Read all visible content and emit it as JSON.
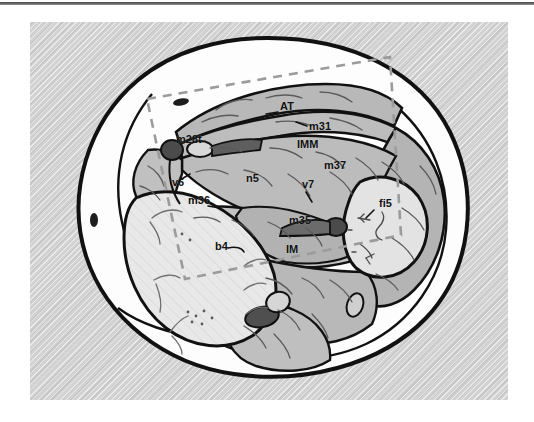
{
  "figure": {
    "type": "anatomical-cross-section-illustration",
    "caption": "",
    "plate_background_color": "#d2d2d2",
    "ink_color": "#111111",
    "roi_outline_color": "#9b9b9b",
    "roi_outline_style": "dashed",
    "fills": {
      "skin_fat_layer": "#fdfdfd",
      "muscle_mid_gray": "#b4b4b4",
      "muscle_light_gray": "#c9c9c9",
      "bone_pale": "#e6e6e6",
      "vessel_dark": "#3c3c3c",
      "vessel_mid": "#6e6e6e"
    },
    "labels": [
      {
        "id": "AT",
        "text": "AT",
        "x": 250,
        "y": 88,
        "size": 11
      },
      {
        "id": "m31",
        "text": "m31",
        "x": 279,
        "y": 108,
        "size": 11
      },
      {
        "id": "m28t",
        "text": "m28t",
        "x": 146,
        "y": 121,
        "size": 11
      },
      {
        "id": "IMM",
        "text": "IMM",
        "x": 267,
        "y": 126,
        "size": 11
      },
      {
        "id": "v6",
        "text": "v6",
        "x": 142,
        "y": 164,
        "size": 11
      },
      {
        "id": "n5",
        "text": "n5",
        "x": 216,
        "y": 160,
        "size": 11
      },
      {
        "id": "m37",
        "text": "m37",
        "x": 294,
        "y": 147,
        "size": 11
      },
      {
        "id": "v7",
        "text": "v7",
        "x": 272,
        "y": 166,
        "size": 11
      },
      {
        "id": "m36",
        "text": "m36",
        "x": 158,
        "y": 182,
        "size": 11
      },
      {
        "id": "m35",
        "text": "m35",
        "x": 259,
        "y": 202,
        "size": 11
      },
      {
        "id": "fi5",
        "text": "fi5",
        "x": 349,
        "y": 185,
        "size": 11
      },
      {
        "id": "IM",
        "text": "IM",
        "x": 256,
        "y": 231,
        "size": 11
      },
      {
        "id": "b4",
        "text": "b4",
        "x": 185,
        "y": 228,
        "size": 11
      }
    ],
    "roi": {
      "name": "region-of-interest-box",
      "points": "117,77 360,35 371,213 155,257"
    }
  }
}
